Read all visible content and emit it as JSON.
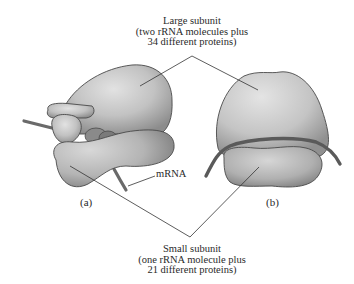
{
  "diagram": {
    "large_subunit": {
      "title": "Large subunit",
      "line2": "(two rRNA molecules plus",
      "line3": "34 different proteins)"
    },
    "small_subunit": {
      "title": "Small subunit",
      "line2": "(one rRNA molecule plus",
      "line3": "21 different proteins)"
    },
    "mrna_label": "mRNA",
    "panel_a": "(a)",
    "panel_b": "(b)",
    "colors": {
      "subunit_fill": "#c4c4c4",
      "subunit_shade": "#8e8e8e",
      "subunit_outline": "#4a4a4a",
      "mrna_strand": "#6a6a6a",
      "leader_line": "#333333",
      "text": "#2a2a2a"
    }
  }
}
